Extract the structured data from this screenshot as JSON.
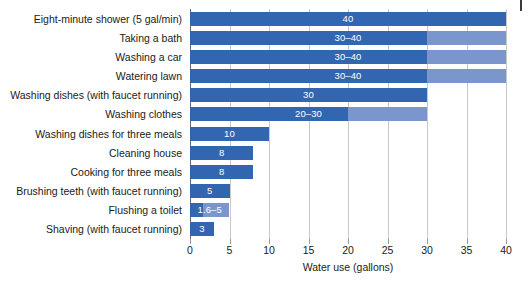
{
  "chart_data": {
    "type": "bar",
    "orientation": "horizontal",
    "title": "",
    "xlabel": "Water use (gallons)",
    "ylabel": "",
    "xlim": [
      0,
      40
    ],
    "xticks": [
      0,
      5,
      10,
      15,
      20,
      25,
      30,
      35,
      40
    ],
    "xtick_labels": [
      "0",
      "5",
      "10",
      "15",
      "20",
      "25",
      "30",
      "35",
      "40"
    ],
    "grid": true,
    "legend": "none",
    "colors": {
      "bar_min": "#3366b0",
      "bar_max": "#7b96cc",
      "gridline": "#c9c9c9",
      "axis": "#6b6b6b",
      "text": "#1a1a1a",
      "bar_text": "#ffffff",
      "background": "#ffffff"
    },
    "categories": [
      "Eight-minute shower (5 gal/min)",
      "Taking a bath",
      "Washing a car",
      "Watering lawn",
      "Washing dishes (with faucet running)",
      "Washing clothes",
      "Washing dishes for three meals",
      "Cleaning house",
      "Cooking for three meals",
      "Brushing teeth (with faucet running)",
      "Flushing a toilet",
      "Shaving (with faucet running)"
    ],
    "values": [
      {
        "min": 40,
        "max": 40,
        "label": "40"
      },
      {
        "min": 30,
        "max": 40,
        "label": "30–40"
      },
      {
        "min": 30,
        "max": 40,
        "label": "30–40"
      },
      {
        "min": 30,
        "max": 40,
        "label": "30–40"
      },
      {
        "min": 30,
        "max": 30,
        "label": "30"
      },
      {
        "min": 20,
        "max": 30,
        "label": "20–30"
      },
      {
        "min": 10,
        "max": 10,
        "label": "10"
      },
      {
        "min": 8,
        "max": 8,
        "label": "8"
      },
      {
        "min": 8,
        "max": 8,
        "label": "8"
      },
      {
        "min": 5,
        "max": 5,
        "label": "5"
      },
      {
        "min": 1.6,
        "max": 5,
        "label": "1.6–5"
      },
      {
        "min": 3,
        "max": 3,
        "label": "3"
      }
    ]
  }
}
